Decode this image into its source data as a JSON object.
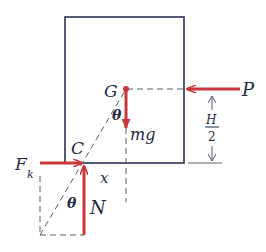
{
  "diagram": {
    "type": "free-body-diagram",
    "colors": {
      "outline": "#2b3350",
      "force": "#c8383a",
      "dashed": "#555c6e",
      "text": "#1f2a44"
    },
    "labels": {
      "center_of_mass": "G",
      "weight": "mg",
      "applied_force": "P",
      "friction": "F",
      "friction_subscript": "k",
      "contact_point": "C",
      "normal_force": "N",
      "offset": "x",
      "angle_top": "θ",
      "angle_bottom": "θ",
      "height_numerator": "H",
      "height_denominator": "2"
    }
  }
}
